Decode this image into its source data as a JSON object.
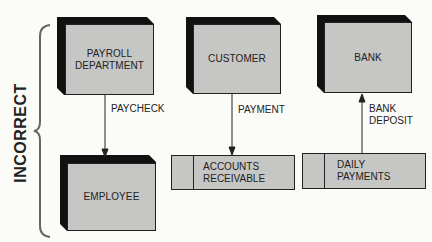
{
  "diagram": {
    "type": "data-flow",
    "side_label": "INCORRECT",
    "entities": [
      {
        "id": "payroll",
        "label": "PAYROLL\nDEPARTMENT"
      },
      {
        "id": "customer",
        "label": "CUSTOMER"
      },
      {
        "id": "bank",
        "label": "BANK"
      },
      {
        "id": "employee",
        "label": "EMPLOYEE"
      }
    ],
    "data_stores": [
      {
        "id": "ar",
        "label": "ACCOUNTS\nRECEIVABLE"
      },
      {
        "id": "daily",
        "label": "DAILY\nPAYMENTS"
      }
    ],
    "flows": [
      {
        "from": "payroll",
        "to": "employee",
        "label": "PAYCHECK"
      },
      {
        "from": "customer",
        "to": "ar",
        "label": "PAYMENT"
      },
      {
        "from": "daily",
        "to": "bank",
        "label": "BANK\nDEPOSIT"
      }
    ],
    "colors": {
      "face": "#c6c6c4",
      "shadow": "#111111",
      "background": "#fbfbf8",
      "line": "#222222"
    }
  }
}
